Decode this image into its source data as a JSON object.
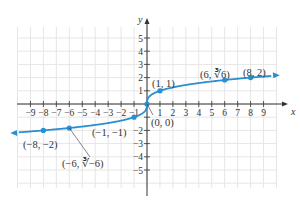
{
  "chart_data": {
    "type": "line",
    "title": "",
    "function": "y = cube_root(x)",
    "xlabel": "x",
    "ylabel": "y",
    "xlim": [
      -10,
      10
    ],
    "ylim": [
      -6,
      6
    ],
    "grid": true,
    "x_ticks": [
      -9,
      -8,
      -7,
      -6,
      -5,
      -4,
      -3,
      -2,
      -1,
      1,
      2,
      3,
      4,
      5,
      6,
      7,
      8,
      9
    ],
    "x_tick_labels": [
      "−9",
      "−8",
      "−7",
      "−6",
      "−5",
      "−4",
      "−3",
      "−2",
      "−1",
      "1",
      "2",
      "3",
      "4",
      "5",
      "6",
      "7",
      "8",
      "9"
    ],
    "y_ticks": [
      -5,
      -4,
      -3,
      -2,
      -1,
      1,
      2,
      3,
      4,
      5
    ],
    "y_tick_labels": [
      "−5",
      "−4",
      "−3",
      "−2",
      "",
      "1",
      "2",
      "3",
      "4",
      "5"
    ],
    "series": [
      {
        "name": "y = ∛x",
        "x_range": [
          -10,
          10
        ],
        "color": "#2a8fd0",
        "arrows": "both"
      }
    ],
    "points": [
      {
        "x": -8,
        "y": -2,
        "label": "(−8, −2)"
      },
      {
        "x": -6,
        "y": -1.817,
        "label": "(−6, ∛−6)"
      },
      {
        "x": -1,
        "y": -1,
        "label": "(−1, −1)"
      },
      {
        "x": 0,
        "y": 0,
        "label": "(0, 0)"
      },
      {
        "x": 1,
        "y": 1,
        "label": "(1, 1)"
      },
      {
        "x": 6,
        "y": 1.817,
        "label": "(6, ∛6)"
      },
      {
        "x": 8,
        "y": 2,
        "label": "(8, 2)"
      }
    ]
  },
  "colors": {
    "curve": "#2a8fd0",
    "axis": "#333333",
    "grid": "#e6e6e6"
  }
}
